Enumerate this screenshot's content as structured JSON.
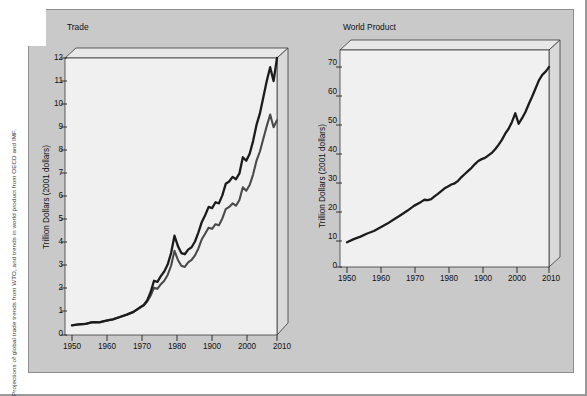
{
  "caption": {
    "side_note": "Projections of global trade trends from WTO, and trends in world product from OECD and IMF."
  },
  "colors": {
    "card_background": "#c9c9c9",
    "plot_background": "#f0f0f0",
    "panel_side": "#d8d8d8",
    "panel_top": "#e6e6e6",
    "series_primary": "#1c1c1c",
    "series_secondary": "#4a4a4a",
    "axis": "#111111"
  },
  "panels": [
    {
      "id": "trade",
      "title": "Trade",
      "ylabel": "Trillion Dollars (2001 dollars)",
      "legend": [
        {
          "label": "Goods and services",
          "color_key": "series_primary"
        },
        {
          "label": "Goods",
          "color_key": "series_secondary"
        }
      ]
    },
    {
      "id": "world-product",
      "title": "World Product",
      "ylabel": "Trillion Dollars (2001 dollars)",
      "legend": []
    }
  ],
  "chart_data": [
    {
      "type": "line",
      "title": "Trade",
      "xlabel": "",
      "ylabel": "Trillion Dollars (2001 dollars)",
      "xlim": [
        1950,
        2010
      ],
      "ylim": [
        0,
        12
      ],
      "xticks": [
        1950,
        1960,
        1970,
        1980,
        1900,
        2000,
        2010
      ],
      "xtick_values": [
        1950,
        1960,
        1970,
        1980,
        1990,
        2000,
        2010
      ],
      "yticks": [
        0,
        1,
        2,
        3,
        4,
        5,
        6,
        7,
        8,
        9,
        10,
        11,
        12
      ],
      "grid": false,
      "legend_position": "upper-left-inside",
      "series": [
        {
          "name": "Goods and services",
          "color": "#1c1c1c",
          "x": [
            1950,
            1952,
            1954,
            1956,
            1958,
            1960,
            1962,
            1964,
            1966,
            1968,
            1970,
            1971,
            1972,
            1973,
            1974,
            1975,
            1976,
            1977,
            1978,
            1979,
            1980,
            1981,
            1982,
            1983,
            1984,
            1985,
            1986,
            1987,
            1988,
            1989,
            1990,
            1991,
            1992,
            1993,
            1994,
            1995,
            1996,
            1997,
            1998,
            1999,
            2000,
            2001,
            2002,
            2003,
            2004,
            2005,
            2006,
            2007,
            2008,
            2009,
            2010
          ],
          "y": [
            0.42,
            0.46,
            0.48,
            0.56,
            0.55,
            0.62,
            0.68,
            0.78,
            0.88,
            1.0,
            1.2,
            1.3,
            1.5,
            1.85,
            2.35,
            2.3,
            2.55,
            2.75,
            3.05,
            3.55,
            4.3,
            3.85,
            3.55,
            3.5,
            3.7,
            3.8,
            4.05,
            4.45,
            4.9,
            5.2,
            5.55,
            5.5,
            5.75,
            5.7,
            6.05,
            6.55,
            6.65,
            6.85,
            6.75,
            7.0,
            7.7,
            7.55,
            7.85,
            8.4,
            9.1,
            9.6,
            10.3,
            11.0,
            11.6,
            11.0,
            12.0
          ]
        },
        {
          "name": "Goods",
          "color": "#4a4a4a",
          "x": [
            1950,
            1952,
            1954,
            1956,
            1958,
            1960,
            1962,
            1964,
            1966,
            1968,
            1970,
            1971,
            1972,
            1973,
            1974,
            1975,
            1976,
            1977,
            1978,
            1979,
            1980,
            1981,
            1982,
            1983,
            1984,
            1985,
            1986,
            1987,
            1988,
            1989,
            1990,
            1991,
            1992,
            1993,
            1994,
            1995,
            1996,
            1997,
            1998,
            1999,
            2000,
            2001,
            2002,
            2003,
            2004,
            2005,
            2006,
            2007,
            2008,
            2009,
            2010
          ],
          "y": [
            0.42,
            0.46,
            0.48,
            0.56,
            0.55,
            0.62,
            0.68,
            0.78,
            0.88,
            1.0,
            1.2,
            1.28,
            1.45,
            1.7,
            2.05,
            2.0,
            2.2,
            2.35,
            2.6,
            3.0,
            3.65,
            3.25,
            3.0,
            2.95,
            3.15,
            3.25,
            3.45,
            3.75,
            4.15,
            4.4,
            4.65,
            4.6,
            4.8,
            4.75,
            5.05,
            5.45,
            5.55,
            5.7,
            5.6,
            5.85,
            6.4,
            6.25,
            6.5,
            6.95,
            7.55,
            7.95,
            8.5,
            9.05,
            9.55,
            9.0,
            9.3
          ]
        }
      ]
    },
    {
      "type": "line",
      "title": "World Product",
      "xlabel": "",
      "ylabel": "Trillion Dollars (2001 dollars)",
      "xlim": [
        1950,
        2010
      ],
      "ylim": [
        0,
        70
      ],
      "xticks": [
        1950,
        1960,
        1970,
        1980,
        1900,
        2000,
        2010
      ],
      "xtick_values": [
        1950,
        1960,
        1970,
        1980,
        1990,
        2000,
        2010
      ],
      "yticks": [
        0,
        10,
        20,
        30,
        40,
        50,
        60,
        70
      ],
      "grid": false,
      "legend_position": "none",
      "series": [
        {
          "name": "World Product",
          "color": "#1c1c1c",
          "x": [
            1950,
            1952,
            1954,
            1956,
            1958,
            1960,
            1962,
            1964,
            1966,
            1968,
            1970,
            1972,
            1973,
            1974,
            1975,
            1976,
            1977,
            1978,
            1979,
            1980,
            1981,
            1982,
            1983,
            1984,
            1985,
            1986,
            1987,
            1988,
            1989,
            1990,
            1991,
            1992,
            1993,
            1994,
            1995,
            1996,
            1997,
            1998,
            1999,
            2000,
            2001,
            2002,
            2003,
            2004,
            2005,
            2006,
            2007,
            2008,
            2009,
            2010
          ],
          "y": [
            8.0,
            9.0,
            9.8,
            10.8,
            11.6,
            12.8,
            14.0,
            15.4,
            16.8,
            18.2,
            19.8,
            21.0,
            21.7,
            21.6,
            21.9,
            22.8,
            23.6,
            24.5,
            25.4,
            26.0,
            26.6,
            27.0,
            27.8,
            29.0,
            30.0,
            31.0,
            32.0,
            33.2,
            34.2,
            34.8,
            35.2,
            36.0,
            36.8,
            38.0,
            39.4,
            41.0,
            43.0,
            44.6,
            46.8,
            49.6,
            46.2,
            48.0,
            50.0,
            52.6,
            55.0,
            57.6,
            60.2,
            62.0,
            63.0,
            64.5
          ]
        }
      ]
    }
  ]
}
